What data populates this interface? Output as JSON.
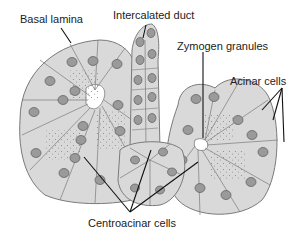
{
  "diagram": {
    "labels": {
      "basal_lamina": "Basal lamina",
      "intercalated_duct": "Intercalated duct",
      "zymogen_granules": "Zymogen granules",
      "acinar_cells": "Acinar cells",
      "centroacinar_cells": "Centroacinar cells"
    },
    "colors": {
      "cell_fill": "#d9d9d9",
      "cell_outline": "#7a7a7a",
      "nucleus_fill": "#9a9a9a",
      "nucleus_outline": "#5a5a5a",
      "granule": "#8a8a8a",
      "leader_line": "#111111",
      "background": "#ffffff"
    }
  }
}
